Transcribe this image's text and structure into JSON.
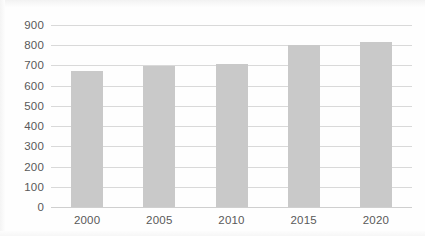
{
  "chart_data": {
    "type": "bar",
    "title": "",
    "subtitle": "",
    "xlabel": "",
    "ylabel": "",
    "categories": [
      "2000",
      "2005",
      "2010",
      "2015",
      "2020"
    ],
    "values": [
      675,
      695,
      708,
      800,
      815
    ],
    "series": [
      {
        "name": "",
        "values": [
          675,
          695,
          708,
          800,
          815
        ]
      }
    ],
    "ylim": [
      0,
      900
    ],
    "ytick_labels": [
      "900",
      "800",
      "700",
      "600",
      "500",
      "400",
      "300",
      "200",
      "100",
      "0"
    ],
    "ytick_values": [
      900,
      800,
      700,
      600,
      500,
      400,
      300,
      200,
      100,
      0
    ],
    "ytick_step": 100,
    "grid": true,
    "grid_axis": "y",
    "legend": false,
    "legend_position": "none",
    "annotations": [],
    "data_labels": false,
    "colors": {
      "bar_fill": "#c9c9c9",
      "gridline": "#d9d9d9",
      "axis_line": "#cfcfcf",
      "tick_label": "#595959",
      "plot_background": "#ffffff"
    }
  }
}
